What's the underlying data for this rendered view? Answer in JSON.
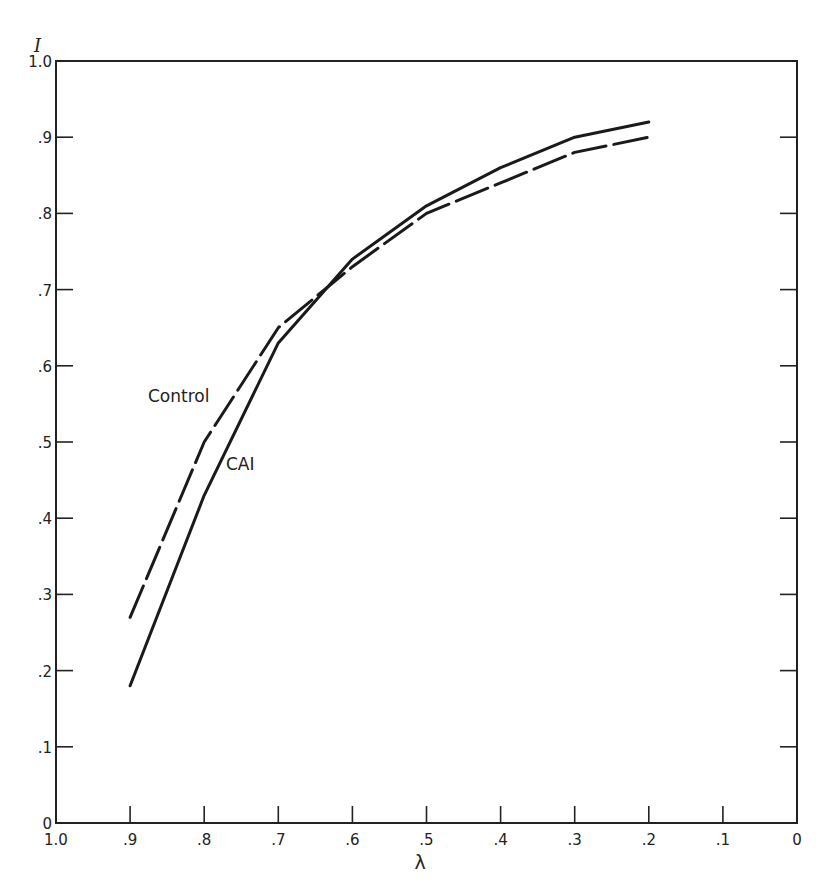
{
  "chart_data": {
    "type": "line",
    "title": "",
    "xlabel": "λ",
    "ylabel": "I",
    "xlim": [
      1.0,
      0
    ],
    "ylim": [
      0,
      1.0
    ],
    "x_reversed": true,
    "grid": false,
    "legend": "inline labels",
    "x_ticks": [
      "1.0",
      ".9",
      ".8",
      ".7",
      ".6",
      ".5",
      ".4",
      ".3",
      ".2",
      ".1",
      "0"
    ],
    "y_ticks": [
      "0",
      ".1",
      ".2",
      ".3",
      ".4",
      ".5",
      ".6",
      ".7",
      ".8",
      ".9",
      "1.0"
    ],
    "x": [
      0.9,
      0.8,
      0.7,
      0.6,
      0.5,
      0.4,
      0.3,
      0.2
    ],
    "series": [
      {
        "name": "Control",
        "style": "dashed",
        "x": [
          0.9,
          0.8,
          0.7,
          0.6,
          0.5,
          0.4,
          0.3,
          0.2
        ],
        "values": [
          0.27,
          0.5,
          0.65,
          0.73,
          0.8,
          0.84,
          0.88,
          0.9
        ]
      },
      {
        "name": "CAI",
        "style": "solid",
        "x": [
          0.9,
          0.8,
          0.7,
          0.6,
          0.5,
          0.4,
          0.3,
          0.2
        ],
        "values": [
          0.18,
          0.43,
          0.63,
          0.74,
          0.81,
          0.86,
          0.9,
          0.92
        ]
      }
    ]
  },
  "labels": {
    "y_axis": "I",
    "x_axis": "λ",
    "control": "Control",
    "cai": "CAI"
  }
}
